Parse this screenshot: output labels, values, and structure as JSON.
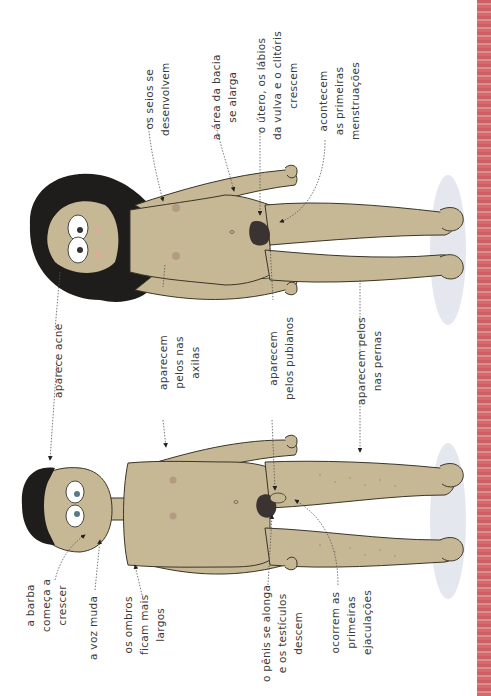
{
  "colors": {
    "skin": "#c6b795",
    "skin_outline": "#3a3528",
    "hair": "#1f1c1c",
    "pubic_hair": "#3a3332",
    "nipple": "#b39a80",
    "floor_shadow": "#e4e7ee",
    "stripe": "#d46a6f",
    "text": "#3a3a3a",
    "leader": "#555555"
  },
  "figures": [
    {
      "name": "female",
      "description": "menina"
    },
    {
      "name": "male",
      "description": "menino"
    }
  ],
  "labels": {
    "female": {
      "breasts": [
        "os seios se",
        "desenvolvem"
      ],
      "hips": [
        "a área da bacia",
        "se alarga"
      ],
      "uterus": [
        "o útero, os lábios",
        "da vulva e o clitóris",
        "crescem"
      ],
      "menstruation": [
        "acontecem",
        "as primeiras",
        "menstruações"
      ]
    },
    "shared": {
      "acne": [
        "aparece acne"
      ],
      "armpit_hair": [
        "aparecem",
        "pelos nas",
        "axilas"
      ],
      "pubic_hair": [
        "aparecem",
        "pelos pubianos"
      ],
      "leg_hair": [
        "aparecem pelos",
        "nas pernas"
      ]
    },
    "male": {
      "beard": [
        "a barba",
        "começa a",
        "crescer"
      ],
      "voice": [
        "a voz muda"
      ],
      "shoulders": [
        "os ombros",
        "ficam mais",
        "largos"
      ],
      "penis": [
        "o pênis se alonga",
        "e os testículos",
        "descem"
      ],
      "ejaculation": [
        "ocorrem as",
        "primeiras",
        "ejaculações"
      ]
    }
  }
}
